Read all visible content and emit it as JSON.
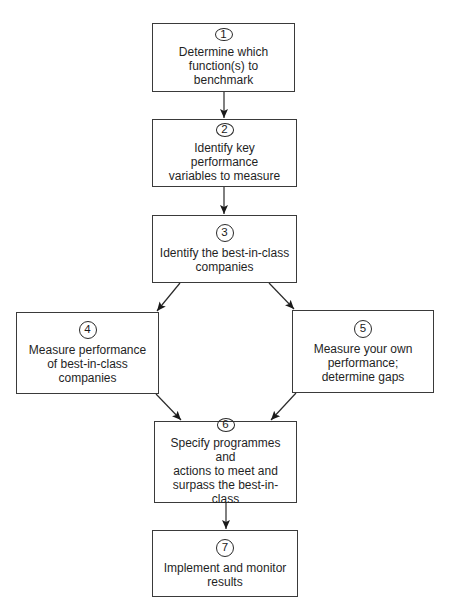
{
  "diagram": {
    "type": "flowchart",
    "steps": [
      {
        "number": "1",
        "text": "Determine which\nfunction(s) to benchmark"
      },
      {
        "number": "2",
        "text": "Identify key performance\nvariables to measure"
      },
      {
        "number": "3",
        "text": "Identify the best-in-class\ncompanies"
      },
      {
        "number": "4",
        "text": "Measure performance\nof best-in-class\ncompanies"
      },
      {
        "number": "5",
        "text": "Measure your own\nperformance;\ndetermine gaps"
      },
      {
        "number": "6",
        "text": "Specify programmes and\nactions to meet and\nsurpass the best-in-class"
      },
      {
        "number": "7",
        "text": "Implement and monitor\nresults"
      }
    ],
    "edges": [
      {
        "from": "1",
        "to": "2"
      },
      {
        "from": "2",
        "to": "3"
      },
      {
        "from": "3",
        "to": "4"
      },
      {
        "from": "3",
        "to": "5"
      },
      {
        "from": "4",
        "to": "6"
      },
      {
        "from": "5",
        "to": "6"
      },
      {
        "from": "6",
        "to": "7"
      }
    ],
    "colors": {
      "line": "#2a2a2a",
      "border": "#3a3a3a",
      "background": "#ffffff",
      "text": "#1f1f1f"
    }
  }
}
